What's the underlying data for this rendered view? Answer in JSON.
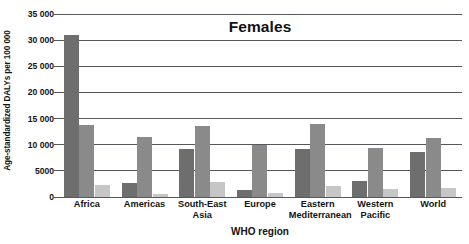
{
  "chart_data": {
    "type": "bar",
    "title": "Females",
    "xlabel": "WHO region",
    "ylabel": "Age-standardized DALYs per 100 000",
    "categories": [
      "Africa",
      "Americas",
      "South-East Asia",
      "Europe",
      "Eastern Mediterranean",
      "Western Pacific",
      "World"
    ],
    "category_lines": [
      [
        "Africa"
      ],
      [
        "Americas"
      ],
      [
        "South-East",
        "Asia"
      ],
      [
        "Europe"
      ],
      [
        "Eastern",
        "Mediterranean"
      ],
      [
        "Western",
        "Pacific"
      ],
      [
        "World"
      ]
    ],
    "series": [
      {
        "name": "series-1",
        "color": "#6e6e6e",
        "values": [
          31000,
          2700,
          9200,
          1400,
          9200,
          3000,
          8700
        ]
      },
      {
        "name": "series-2",
        "color": "#8a8a8a",
        "values": [
          13700,
          11400,
          13500,
          9900,
          13900,
          9400,
          11200
        ]
      },
      {
        "name": "series-3",
        "color": "#c6c6c6",
        "values": [
          2300,
          600,
          2900,
          700,
          2100,
          1500,
          1700
        ]
      }
    ],
    "ylim": [
      0,
      35000
    ],
    "yticks": [
      0,
      5000,
      10000,
      15000,
      20000,
      25000,
      30000,
      35000
    ],
    "ytick_labels": [
      "0",
      "5000",
      "10 000",
      "15 000",
      "20 000",
      "25 000",
      "30 000",
      "35 000"
    ],
    "grid": true,
    "legend": "none"
  }
}
